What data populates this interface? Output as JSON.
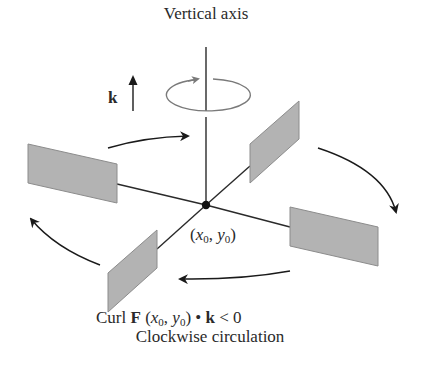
{
  "diagram": {
    "title": "Vertical axis",
    "k_label": "k",
    "point": {
      "open": "(",
      "x_var": "x",
      "x_sub": "0",
      "sep": ", ",
      "y_var": "y",
      "y_sub": "0",
      "close": ")"
    },
    "caption": {
      "line1_prefix": "Curl ",
      "line1_vector": "F",
      "line1_args_open": " (",
      "line1_x": "x",
      "line1_x_sub": "0",
      "line1_sep": ", ",
      "line1_y": "y",
      "line1_y_sub": "0",
      "line1_args_close": ")",
      "line1_dot": " • ",
      "line1_k": "k",
      "line1_relation": " < 0",
      "line2": "Clockwise circulation"
    },
    "colors": {
      "line": "#2a2a2a",
      "paddle_fill": "#b3b3b3",
      "paddle_edge": "#8c8c8c",
      "ellipse": "#7a7a7a",
      "background": "#ffffff"
    },
    "elements": {
      "center": [
        206,
        205
      ],
      "paddles": [
        "left",
        "upper-right",
        "right",
        "lower-left"
      ],
      "circulation_arrows": 4,
      "rotation_indicator": "ellipse-arrow-clockwise"
    }
  }
}
